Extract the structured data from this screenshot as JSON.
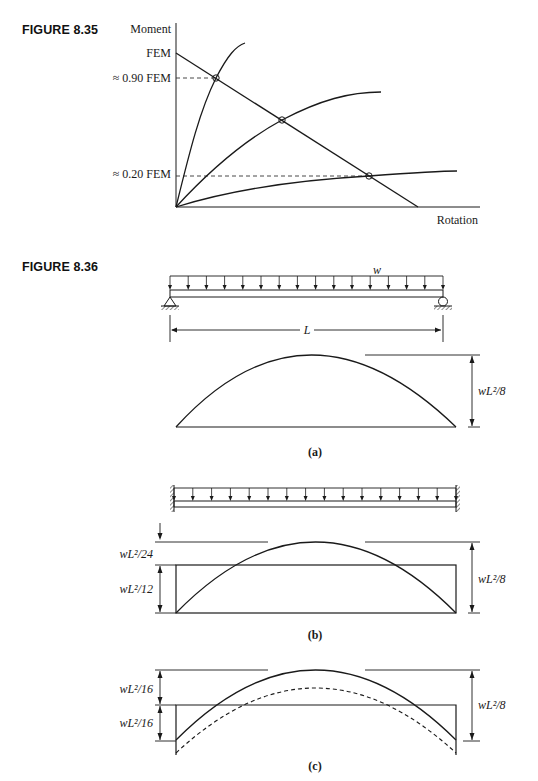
{
  "figures": [
    {
      "id": "8.35",
      "label": "FIGURE 8.35",
      "axis_y_label": "Moment",
      "axis_x_label": "Rotation",
      "y_ticks": [
        {
          "label": "FEM",
          "value": 1.0
        },
        {
          "label": "≈ 0.90 FEM",
          "value": 0.9
        },
        {
          "label": "≈ 0.20 FEM",
          "value": 0.2
        }
      ]
    },
    {
      "id": "8.36",
      "label": "FIGURE 8.36",
      "load_label": "w",
      "span_label": "L",
      "panels": [
        {
          "caption": "(a)",
          "support": "simply-supported",
          "labels": {
            "height": "wL²/8"
          }
        },
        {
          "caption": "(b)",
          "support": "fixed-fixed",
          "labels": {
            "upper": "wL²/24",
            "lower": "wL²/12",
            "height": "wL²/8"
          }
        },
        {
          "caption": "(c)",
          "support": "partial-fixity",
          "labels": {
            "upper": "wL²/16",
            "lower": "wL²/16",
            "height": "wL²/8"
          }
        }
      ]
    }
  ],
  "chart_data": {
    "type": "line",
    "title": "FIGURE 8.35",
    "xlabel": "Rotation",
    "ylabel": "Moment",
    "ylim": [
      0,
      1.2
    ],
    "xlim": [
      0,
      1.0
    ],
    "y_tick_labels": [
      "FEM",
      "≈ 0.90 FEM",
      "≈ 0.20 FEM"
    ],
    "series": [
      {
        "name": "beam-line",
        "style": "straight",
        "points": [
          [
            0,
            1.0
          ],
          [
            0.8,
            0
          ]
        ]
      },
      {
        "name": "stiff-connection",
        "style": "curve",
        "points": [
          [
            0,
            0
          ],
          [
            0.05,
            0.5
          ],
          [
            0.1,
            0.9
          ],
          [
            0.18,
            1.13
          ]
        ]
      },
      {
        "name": "medium-connection",
        "style": "curve",
        "points": [
          [
            0,
            0
          ],
          [
            0.1,
            0.3
          ],
          [
            0.35,
            0.63
          ],
          [
            0.66,
            0.8
          ]
        ]
      },
      {
        "name": "flexible-connection",
        "style": "curve",
        "points": [
          [
            0,
            0
          ],
          [
            0.2,
            0.12
          ],
          [
            0.6,
            0.2
          ],
          [
            1.0,
            0.23
          ]
        ]
      }
    ],
    "intersections": [
      {
        "x": 0.12,
        "y": 0.9,
        "label": "≈ 0.90 FEM"
      },
      {
        "x": 0.33,
        "y": 0.6
      },
      {
        "x": 0.6,
        "y": 0.2,
        "label": "≈ 0.20 FEM"
      }
    ],
    "grid": false
  }
}
